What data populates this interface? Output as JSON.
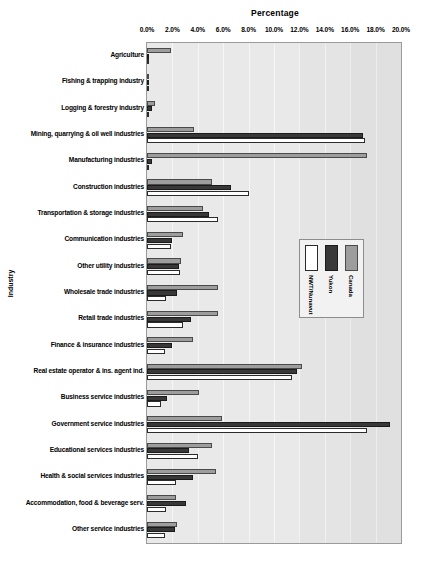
{
  "chart_data": {
    "type": "bar",
    "orientation": "horizontal",
    "xlabel": "Percentage",
    "ylabel": "Industry",
    "xlim": [
      0,
      20
    ],
    "xticks": [
      "0.0%",
      "2.0%",
      "4.0%",
      "6.0%",
      "8.0%",
      "10.0%",
      "12.0%",
      "14.0%",
      "16.0%",
      "18.0%",
      "20.0%"
    ],
    "xtick_values": [
      0,
      2,
      4,
      6,
      8,
      10,
      12,
      14,
      16,
      18,
      20
    ],
    "grid": true,
    "legend_position": "center-right-inside",
    "categories": [
      "Agriculture",
      "Fishing & trapping industry",
      "Logging & forestry industry",
      "Mining, quarrying & oil well industries",
      "Manufacturing industries",
      "Construction industries",
      "Transportation & storage industries",
      "Communication industries",
      "Other utility industries",
      "Wholesale trade industries",
      "Retail trade industries",
      "Finance & insurance industries",
      "Real estate operator & ins. agent ind.",
      "Business service industries",
      "Government service industries",
      "Educational services industries",
      "Health & social services industries",
      "Accommodation, food & beverage serv.",
      "Other service industries"
    ],
    "series": [
      {
        "name": "NWT/Nunavut",
        "color": "#ffffff",
        "values": [
          0.0,
          0.1,
          0.1,
          17.2,
          0.1,
          8.0,
          5.6,
          1.9,
          2.6,
          1.5,
          2.8,
          1.4,
          11.4,
          1.1,
          17.3,
          4.0,
          2.3,
          1.5,
          1.4
        ]
      },
      {
        "name": "Yukon",
        "color": "#383838",
        "values": [
          0.1,
          0.1,
          0.4,
          17.0,
          0.4,
          6.6,
          4.9,
          2.0,
          2.5,
          2.4,
          3.5,
          2.0,
          11.8,
          1.6,
          19.1,
          3.3,
          3.6,
          3.1,
          2.2
        ]
      },
      {
        "name": "Canada",
        "color": "#9d9d9d",
        "values": [
          1.9,
          0.1,
          0.6,
          3.7,
          17.3,
          5.1,
          4.4,
          2.8,
          2.7,
          5.6,
          5.6,
          3.6,
          12.2,
          4.1,
          5.9,
          5.1,
          5.4,
          2.3,
          2.4
        ]
      }
    ]
  }
}
